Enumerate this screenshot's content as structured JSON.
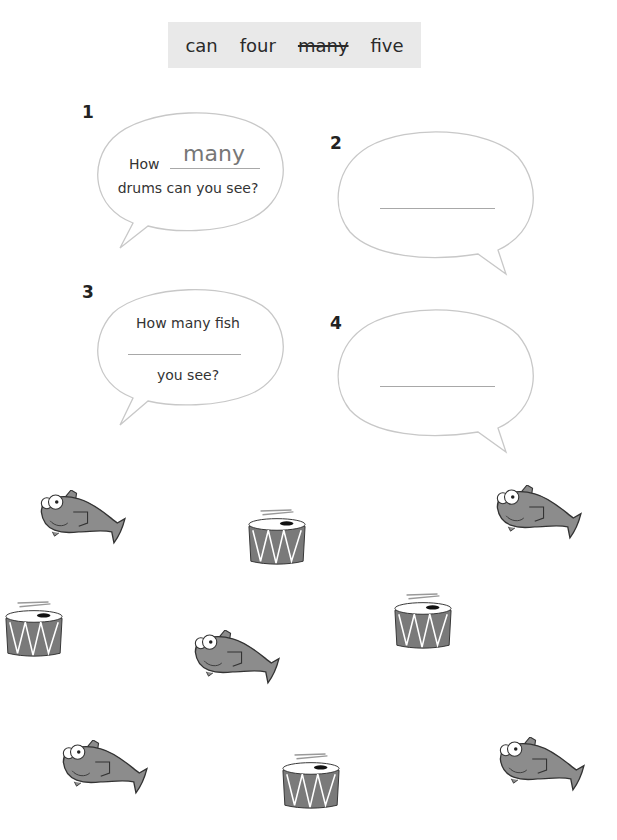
{
  "word_bank": {
    "words": [
      {
        "text": "can",
        "struck": false
      },
      {
        "text": "four",
        "struck": false
      },
      {
        "text": "many",
        "struck": true
      },
      {
        "text": "five",
        "struck": false
      }
    ]
  },
  "questions": [
    {
      "number": "1",
      "line1_prefix": "How",
      "answer": "many",
      "line2": "drums can you see?"
    },
    {
      "number": "2",
      "answer": ""
    },
    {
      "number": "3",
      "line1": "How many fish",
      "answer": "",
      "line2": "you see?"
    },
    {
      "number": "4",
      "answer": ""
    }
  ],
  "pictures": {
    "fish_count": 6,
    "drum_count": 4,
    "colors": {
      "body": "#8c8c8c",
      "outline": "#333333",
      "box": "#e9e9e9"
    }
  }
}
